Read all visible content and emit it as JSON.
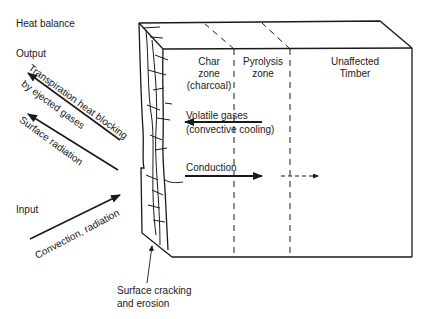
{
  "title": "Heat balance",
  "sections": {
    "output": "Output",
    "input": "Input"
  },
  "arrows": {
    "transpiration": {
      "line1": "Transpiration heat blocking",
      "line2": "by ejected gases",
      "direction": "outward"
    },
    "surface_radiation": {
      "label": "Surface radiation",
      "direction": "outward"
    },
    "convection_radiation": {
      "label": "Convection, radiation",
      "direction": "inward"
    },
    "volatile_gases": {
      "line1": "Volatile gases",
      "line2": "(convective cooling)",
      "direction": "toward surface"
    },
    "conduction": {
      "label": "Conduction",
      "direction": "into timber"
    }
  },
  "zones": [
    {
      "line1": "Char",
      "line2": "zone",
      "line3": "(charcoal)"
    },
    {
      "line1": "Pyrolysis",
      "line2": "zone"
    },
    {
      "line1": "Unaffected",
      "line2": "Timber"
    }
  ],
  "annotations": {
    "surface": {
      "line1": "Surface cracking",
      "line2": "and erosion"
    }
  },
  "colors": {
    "ink": "#1a1a1a",
    "background": "#ffffff"
  }
}
